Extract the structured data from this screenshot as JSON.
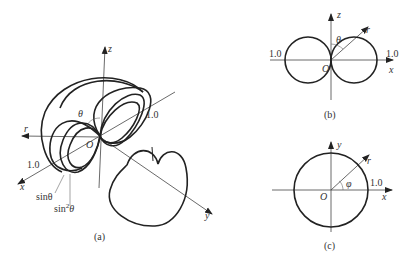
{
  "figure": {
    "panel_a": {
      "caption": "(a)",
      "axes": {
        "x": "x",
        "y": "y",
        "z": "z",
        "r": "r"
      },
      "origin": "O",
      "angle": "θ",
      "scale_labels": [
        "1.0",
        "1.0"
      ],
      "curve_labels": {
        "sin": "sinθ",
        "sin2_base": "sin",
        "sin2_exp": "2",
        "sin2_theta": "θ"
      }
    },
    "panel_b": {
      "caption": "(b)",
      "axes": {
        "x": "x",
        "z": "z",
        "r": "r"
      },
      "origin": "O",
      "angle": "θ",
      "scale_labels": [
        "1.0",
        "1.0"
      ]
    },
    "panel_c": {
      "caption": "(c)",
      "axes": {
        "x": "x",
        "y": "y",
        "r": "r"
      },
      "origin": "O",
      "angle": "φ",
      "scale_labels": [
        "1.0"
      ]
    }
  }
}
